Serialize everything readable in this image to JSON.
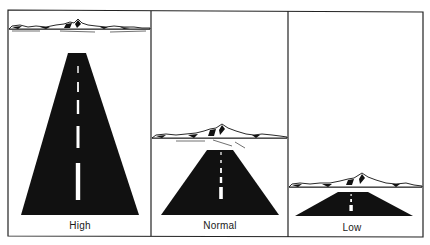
{
  "figure": {
    "colors": {
      "ink": "#111111",
      "paper": "#ffffff",
      "border": "#222222"
    },
    "panels": [
      {
        "id": "high",
        "label": "High",
        "horizon_y": 29,
        "peak": [
          78,
          20
        ],
        "road_top": [
          68,
          86,
          53
        ],
        "road_bottom": [
          21,
          139,
          215
        ],
        "dashes": [
          [
            66,
            73
          ],
          [
            82,
            92
          ],
          [
            100,
            114
          ],
          [
            126,
            148
          ],
          [
            163,
            200
          ]
        ]
      },
      {
        "id": "normal",
        "label": "Normal",
        "horizon_y": 138,
        "peak": [
          222,
          125
        ],
        "road_top": [
          207,
          233,
          150
        ],
        "road_bottom": [
          161,
          279,
          215
        ],
        "dashes": [
          [
            152,
            155
          ],
          [
            160,
            163
          ],
          [
            168,
            173
          ],
          [
            177,
            183
          ],
          [
            187,
            199
          ]
        ]
      },
      {
        "id": "low",
        "label": "Low",
        "horizon_y": 187,
        "peak": [
          362,
          174
        ],
        "road_top": [
          338,
          368,
          192
        ],
        "road_bottom": [
          295,
          413,
          216
        ],
        "dashes": [
          [
            194,
            196
          ],
          [
            199,
            202
          ],
          [
            205,
            211
          ]
        ]
      }
    ]
  }
}
